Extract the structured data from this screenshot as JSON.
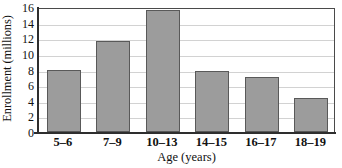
{
  "chart_data": {
    "type": "bar",
    "title": "",
    "xlabel": "Age (years)",
    "ylabel": "Enrollment (millions)",
    "categories": [
      "5–6",
      "7–9",
      "10–13",
      "14–15",
      "16–17",
      "18–19"
    ],
    "values": [
      7.9,
      11.6,
      15.6,
      7.8,
      7.1,
      4.4
    ],
    "ylim": [
      0,
      16
    ],
    "ytick_labels": [
      "0",
      "2",
      "4",
      "6",
      "8",
      "10",
      "12",
      "14",
      "16"
    ],
    "ytick_values": [
      0,
      2,
      4,
      6,
      8,
      10,
      12,
      14,
      16
    ],
    "grid": "horizontal",
    "legend": "none",
    "colors": {
      "bar_fill": "#9c9c9c",
      "bar_edge": "#595959",
      "gridline": "#d2d2d2",
      "axis": "#2e2e2e",
      "plot_border": "#4a4a4a",
      "text": "#111111",
      "background": "#ffffff"
    }
  }
}
